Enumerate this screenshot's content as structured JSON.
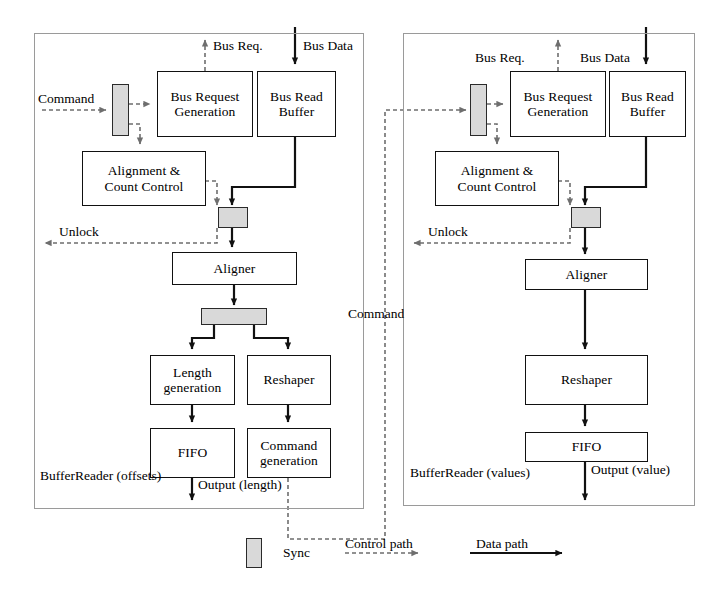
{
  "diagram": {
    "colors": {
      "sync_fill": "#d9d9d9",
      "block_stroke": "#111111",
      "panel_stroke": "#9a9a9a",
      "control_path": "#6e6e6e",
      "data_path": "#111111"
    },
    "left_panel": {
      "name_line1": "BufferReader",
      "name_line2": "(offsets)",
      "io_labels": {
        "command": "Command",
        "bus_req": "Bus Req.",
        "bus_data": "Bus Data",
        "unlock": "Unlock",
        "output_line1": "Output",
        "output_line2": "(length)"
      },
      "blocks": [
        {
          "id": "bus-request-generation",
          "line1": "Bus Request",
          "line2": "Generation"
        },
        {
          "id": "bus-read-buffer",
          "line1": "Bus Read",
          "line2": "Buffer"
        },
        {
          "id": "alignment-count-control",
          "line1": "Alignment &",
          "line2": "Count Control"
        },
        {
          "id": "aligner",
          "line1": "Aligner",
          "line2": ""
        },
        {
          "id": "length-generation",
          "line1": "Length",
          "line2": "generation"
        },
        {
          "id": "reshaper",
          "line1": "Reshaper",
          "line2": ""
        },
        {
          "id": "fifo",
          "line1": "FIFO",
          "line2": ""
        },
        {
          "id": "command-generation",
          "line1": "Command",
          "line2": "generation"
        }
      ]
    },
    "right_panel": {
      "name_line1": "BufferReader",
      "name_line2": "(values)",
      "io_labels": {
        "bus_req": "Bus Req.",
        "bus_data": "Bus Data",
        "unlock": "Unlock",
        "output_line1": "Output",
        "output_line2": "(value)"
      },
      "blocks": [
        {
          "id": "bus-request-generation",
          "line1": "Bus Request",
          "line2": "Generation"
        },
        {
          "id": "bus-read-buffer",
          "line1": "Bus Read",
          "line2": "Buffer"
        },
        {
          "id": "alignment-count-control",
          "line1": "Alignment &",
          "line2": "Count Control"
        },
        {
          "id": "aligner",
          "line1": "Aligner",
          "line2": ""
        },
        {
          "id": "reshaper",
          "line1": "Reshaper",
          "line2": ""
        },
        {
          "id": "fifo",
          "line1": "FIFO",
          "line2": ""
        }
      ]
    },
    "interconnect": {
      "command_label": "Command"
    },
    "legend": {
      "sync": "Sync",
      "control_path": "Control path",
      "data_path": "Data path"
    }
  }
}
